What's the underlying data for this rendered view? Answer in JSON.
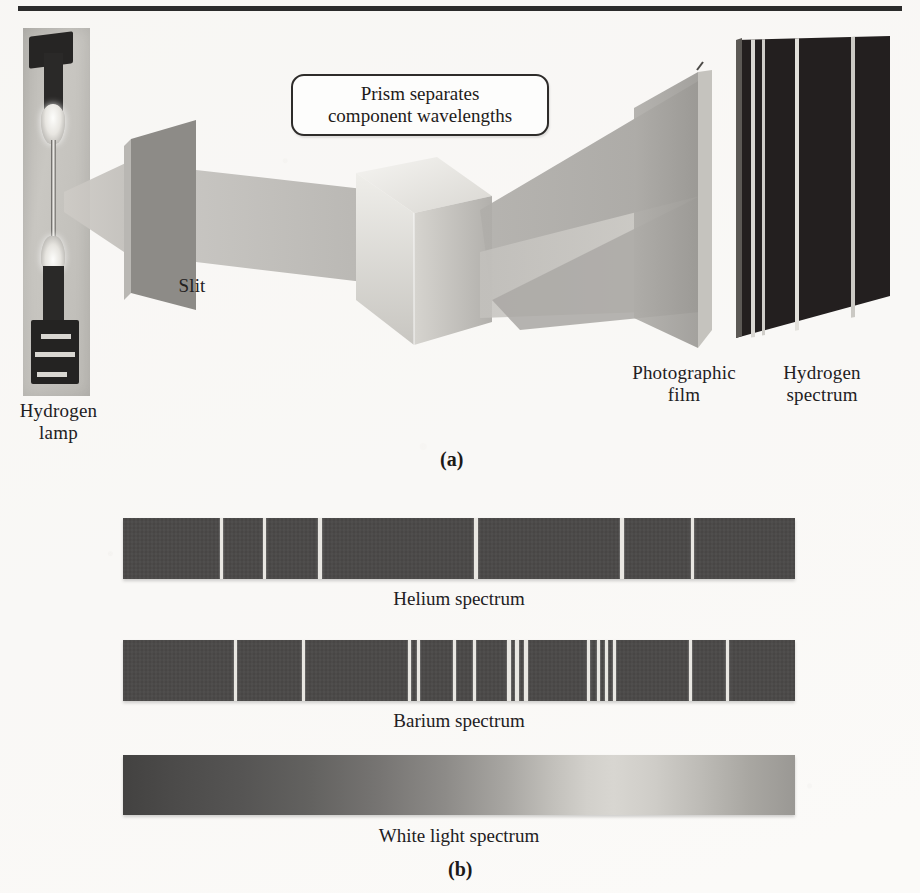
{
  "figure": {
    "panel_a": {
      "letter": "(a)",
      "callout_text": "Prism separates\ncomponent wavelengths",
      "labels": {
        "hydrogen_lamp": "Hydrogen\nlamp",
        "slit": "Slit",
        "photographic_film": "Photographic\nfilm",
        "hydrogen_spectrum": "Hydrogen\nspectrum"
      }
    },
    "panel_b": {
      "letter": "(b)",
      "captions": {
        "helium": "Helium spectrum",
        "barium": "Barium spectrum",
        "white": "White light spectrum"
      }
    }
  },
  "chart_data": {
    "type": "line",
    "xlabel": "Wavelength (increasing to the right)",
    "ylabel": "",
    "grid": false,
    "legend_position": "none",
    "band_geometry": {
      "x": 123,
      "width": 672,
      "height": 61
    },
    "series": [
      {
        "name": "Hydrogen spectrum",
        "kind": "emission-lines",
        "background_color": "#231f1f",
        "line_color": "#d9d7d2",
        "note": "shown on the photographic film / hydrogen spectrum plate in panel (a)",
        "line_positions_pct": [
          10,
          17,
          38,
          74
        ],
        "line_widths_px": [
          2,
          2,
          2,
          2
        ]
      },
      {
        "name": "Helium spectrum",
        "kind": "emission-lines",
        "background_color": "#4a4847",
        "line_color": "#e9e7e2",
        "line_positions_pct": [
          14.7,
          21.1,
          29.3,
          52.5,
          74.3,
          84.7
        ],
        "line_widths_px": [
          3,
          3,
          4,
          4,
          4,
          3
        ]
      },
      {
        "name": "Barium spectrum",
        "kind": "emission-lines",
        "background_color": "#4a4847",
        "line_color": "#e9e7e2",
        "line_positions_pct": [
          16.7,
          26.8,
          42.7,
          43.9,
          49.4,
          52.3,
          57.4,
          58.7,
          59.9,
          69.3,
          70.7,
          72.0,
          73.2,
          84.4,
          90.0
        ],
        "line_widths_px": [
          3,
          3,
          3,
          3,
          3,
          3,
          4,
          4,
          4,
          3,
          3,
          3,
          3,
          3,
          3
        ]
      },
      {
        "name": "White light spectrum",
        "kind": "continuous",
        "note": "continuous grayscale band, darkest at left, brightest near 70% across",
        "gradient_stops_pct": [
          0,
          18,
          38,
          48,
          57,
          64,
          69,
          73,
          79,
          86,
          93,
          100
        ],
        "gradient_colors": [
          "#434241",
          "#565554",
          "#767472",
          "#8d8b88",
          "#a8a6a2",
          "#c2c0bb",
          "#d2d0cb",
          "#d8d6d1",
          "#cfcdc8",
          "#bdbbb6",
          "#a9a7a2",
          "#9a9894"
        ]
      }
    ],
    "annotations": [
      {
        "text": "Prism separates component wavelengths",
        "target": "prism"
      },
      {
        "text": "Slit",
        "target": "slit-plate"
      },
      {
        "text": "Hydrogen lamp",
        "target": "lamp"
      },
      {
        "text": "Photographic film",
        "target": "film-plate"
      },
      {
        "text": "Hydrogen spectrum",
        "target": "spectrum-plate"
      }
    ]
  },
  "colors": {
    "paper": "#fbfaf8",
    "ink": "#22201e",
    "band_dark": "#4a4847",
    "spectrum_plate": "#231f1f",
    "line_light": "#e9e7e2",
    "beam": "#b9b7b3",
    "slit_plate": "#8e8c88",
    "prism_face": "#dedcd7"
  }
}
